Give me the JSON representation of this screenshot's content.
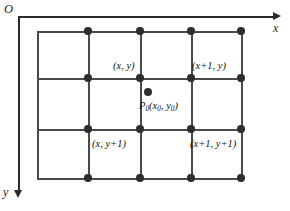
{
  "figure": {
    "title": "",
    "background_color": "#ffffff",
    "line_color": "#4a4a4a",
    "axis_color": "#2b2b2b",
    "dot_color": "#2e2e2e",
    "text_color": "#141414"
  },
  "axes": {
    "origin_label": "O",
    "x_label": "x",
    "y_label": "y",
    "x_arrow_icon": "arrow-right-icon",
    "y_arrow_icon": "arrow-down-icon"
  },
  "grid": {
    "columns": 4,
    "rows": 4,
    "x_positions": [
      37,
      88,
      140,
      191,
      241
    ],
    "y_positions": [
      31,
      78,
      129,
      178
    ],
    "dot_columns": [
      88,
      140,
      191,
      241
    ],
    "dot_rows": [
      31,
      78,
      129,
      178
    ]
  },
  "labels": [
    {
      "id": "label-x-y",
      "text": "(x, y)",
      "x": 113,
      "y": 61
    },
    {
      "id": "label-x1-y",
      "text": "(x+1, y)",
      "x": 192,
      "y": 61
    },
    {
      "id": "label-x-y1",
      "text": "(x, y+1)",
      "x": 92,
      "y": 139
    },
    {
      "id": "label-x1-y1",
      "text": "(x+1, y+1)",
      "x": 190,
      "y": 139
    }
  ],
  "point": {
    "name": "P-zero-point",
    "dot_x": 148,
    "dot_y": 92,
    "label_x": 139,
    "label_y": 101,
    "label_prefix": "P",
    "label_sub": "0",
    "label_open": "(",
    "label_x_var": "x",
    "label_x_sub": "0",
    "label_comma": ", ",
    "label_y_var": "y",
    "label_y_sub": "0",
    "label_close": ")",
    "full_text": "P0(x0, y0)"
  }
}
